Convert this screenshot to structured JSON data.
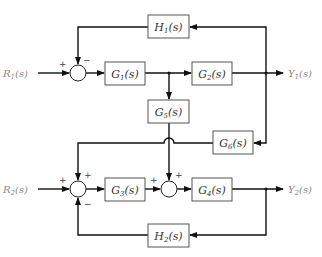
{
  "diagram": {
    "type": "block-diagram",
    "inputs": [
      {
        "id": "R1",
        "name": "R",
        "sub": "1",
        "suffix": "(s)"
      },
      {
        "id": "R2",
        "name": "R",
        "sub": "2",
        "suffix": "(s)"
      }
    ],
    "outputs": [
      {
        "id": "Y1",
        "name": "Y",
        "sub": "1",
        "suffix": "(s)"
      },
      {
        "id": "Y2",
        "name": "Y",
        "sub": "2",
        "suffix": "(s)"
      }
    ],
    "blocks": [
      {
        "id": "G1",
        "name": "G",
        "sub": "1",
        "suffix": "(s)"
      },
      {
        "id": "G2",
        "name": "G",
        "sub": "2",
        "suffix": "(s)"
      },
      {
        "id": "G3",
        "name": "G",
        "sub": "3",
        "suffix": "(s)"
      },
      {
        "id": "G4",
        "name": "G",
        "sub": "4",
        "suffix": "(s)"
      },
      {
        "id": "G5",
        "name": "G",
        "sub": "5",
        "suffix": "(s)"
      },
      {
        "id": "G6",
        "name": "G",
        "sub": "6",
        "suffix": "(s)"
      },
      {
        "id": "H1",
        "name": "H",
        "sub": "1",
        "suffix": "(s)"
      },
      {
        "id": "H2",
        "name": "H",
        "sub": "2",
        "suffix": "(s)"
      }
    ],
    "summing_junctions": [
      {
        "id": "S1",
        "signs": {
          "left": "+",
          "top": "−"
        }
      },
      {
        "id": "S2",
        "signs": {
          "left": "+",
          "top": "+",
          "bottom": "−"
        }
      },
      {
        "id": "S3",
        "signs": {
          "left": "+",
          "top": "+"
        }
      }
    ],
    "connections": [
      {
        "from": "R1",
        "to": "S1",
        "sign": "+"
      },
      {
        "from": "S1",
        "to": "G1"
      },
      {
        "from": "G1",
        "to": "G2"
      },
      {
        "from": "G1",
        "to": "G5"
      },
      {
        "from": "G2",
        "to": "Y1"
      },
      {
        "from": "Y1",
        "to": "H1"
      },
      {
        "from": "H1",
        "to": "S1",
        "sign": "−"
      },
      {
        "from": "Y1",
        "to": "G6"
      },
      {
        "from": "G6",
        "to": "S2",
        "sign": "+"
      },
      {
        "from": "R2",
        "to": "S2",
        "sign": "+"
      },
      {
        "from": "S2",
        "to": "G3"
      },
      {
        "from": "G3",
        "to": "S3",
        "sign": "+"
      },
      {
        "from": "G5",
        "to": "S3",
        "sign": "+"
      },
      {
        "from": "S3",
        "to": "G4"
      },
      {
        "from": "G4",
        "to": "Y2"
      },
      {
        "from": "Y2",
        "to": "H2"
      },
      {
        "from": "H2",
        "to": "S2",
        "sign": "−"
      }
    ]
  },
  "labels": {
    "R1": {
      "main": "R",
      "sub": "1",
      "tail": "(s)"
    },
    "R2": {
      "main": "R",
      "sub": "2",
      "tail": "(s)"
    },
    "Y1": {
      "main": "Y",
      "sub": "1",
      "tail": "(s)"
    },
    "Y2": {
      "main": "Y",
      "sub": "2",
      "tail": "(s)"
    },
    "G1": {
      "main": "G",
      "sub": "1",
      "tail": "(s)"
    },
    "G2": {
      "main": "G",
      "sub": "2",
      "tail": "(s)"
    },
    "G3": {
      "main": "G",
      "sub": "3",
      "tail": "(s)"
    },
    "G4": {
      "main": "G",
      "sub": "4",
      "tail": "(s)"
    },
    "G5": {
      "main": "G",
      "sub": "5",
      "tail": "(s)"
    },
    "G6": {
      "main": "G",
      "sub": "6",
      "tail": "(s)"
    },
    "H1": {
      "main": "H",
      "sub": "1",
      "tail": "(s)"
    },
    "H2": {
      "main": "H",
      "sub": "2",
      "tail": "(s)"
    }
  },
  "signs": {
    "s1_left": "+",
    "s1_top": "−",
    "s2_left": "+",
    "s2_top": "+",
    "s2_bottom": "−",
    "s3_left": "+",
    "s3_top": "+"
  },
  "colors": {
    "wire": "#111111",
    "box_border": "#555555",
    "block_text": "#333333",
    "io_text": "#8a8a8a"
  }
}
